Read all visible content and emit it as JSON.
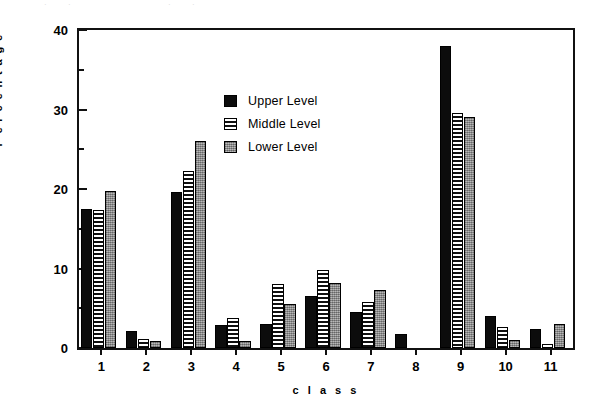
{
  "top_strip": {
    "fragments": [
      {
        "text": "­",
        "left": 4
      },
      {
        "text": "·",
        "left": 44
      },
      {
        "text": "·",
        "left": 68
      },
      {
        "text": "·",
        "left": 168
      },
      {
        "text": "·",
        "left": 192
      }
    ]
  },
  "legend": {
    "items": [
      {
        "label": "Upper Level",
        "swatch": "solid-black",
        "color": "#0c0c0c"
      },
      {
        "label": "Middle Level",
        "swatch": "horizontal-stripes",
        "color": "#111111"
      },
      {
        "label": "Lower Level",
        "swatch": "gray-stipple",
        "color": "#9a9a9a"
      }
    ]
  },
  "chart_data": {
    "type": "bar",
    "title": "",
    "xlabel": "c l a s s",
    "ylabel": "P e r c e n t a g e",
    "categories": [
      "1",
      "2",
      "3",
      "4",
      "5",
      "6",
      "7",
      "8",
      "9",
      "10",
      "11"
    ],
    "series": [
      {
        "name": "Upper Level",
        "color": "#0c0c0c",
        "fill": "solid-black",
        "values": [
          17.5,
          2.2,
          19.6,
          2.9,
          3.0,
          6.5,
          4.5,
          1.8,
          38.0,
          4.0,
          2.4
        ]
      },
      {
        "name": "Middle Level",
        "color": "#111111",
        "fill": "horizontal-stripes",
        "values": [
          17.3,
          1.1,
          22.3,
          3.8,
          8.0,
          9.8,
          5.8,
          0.0,
          29.5,
          2.6,
          0.5
        ]
      },
      {
        "name": "Lower Level",
        "color": "#9a9a9a",
        "fill": "gray-stipple",
        "values": [
          19.8,
          0.9,
          26.0,
          0.9,
          5.5,
          8.2,
          7.3,
          0.0,
          29.0,
          1.0,
          3.0
        ]
      }
    ],
    "ylim": [
      0,
      40
    ],
    "yticks_major": [
      0,
      10,
      20,
      30,
      40
    ],
    "yticks_minor": [
      5,
      15,
      25,
      35
    ],
    "grid": false,
    "legend_position": "upper-center"
  }
}
